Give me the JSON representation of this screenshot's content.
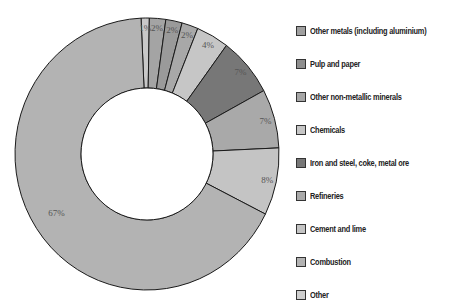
{
  "chart_data": {
    "type": "pie",
    "subtype": "donut",
    "title": "",
    "legend_position": "right",
    "slices_clockwise_from_top": [
      {
        "label": "1%",
        "value": 1,
        "color": "#c8c8c8"
      },
      {
        "label": "2%",
        "value": 2,
        "color": "#a4a4a4"
      },
      {
        "label": "2%",
        "value": 2,
        "color": "#9a9a9a"
      },
      {
        "label": "2%",
        "value": 2,
        "color": "#a8a8a8"
      },
      {
        "label": "4%",
        "value": 4,
        "color": "#c6c6c6"
      },
      {
        "label": "7%",
        "value": 7,
        "color": "#777777"
      },
      {
        "label": "7%",
        "value": 7,
        "color": "#a9a9a9"
      },
      {
        "label": "8%",
        "value": 8,
        "color": "#c4c4c4"
      },
      {
        "label": "67%",
        "value": 67,
        "color": "#b3b3b3"
      }
    ],
    "categories": [
      "Other metals (including aluminium)",
      "Pulp and paper",
      "Other non-metallic minerals",
      "Chemicals",
      "Iron and steel, coke, metal ore",
      "Refineries",
      "Cement and lime",
      "Combustion",
      "Other"
    ],
    "values": [
      1,
      2,
      2,
      4,
      7,
      7,
      8,
      67,
      2
    ]
  },
  "legend": {
    "items": [
      {
        "label": "Other metals (including aluminium)",
        "color": "#a0a0a0"
      },
      {
        "label": "Pulp and paper",
        "color": "#8e8e8e"
      },
      {
        "label": "Other non-metallic minerals",
        "color": "#a6a6a6"
      },
      {
        "label": "Chemicals",
        "color": "#c6c6c6"
      },
      {
        "label": "Iron and steel, coke, metal ore",
        "color": "#777777"
      },
      {
        "label": "Refineries",
        "color": "#a9a9a9"
      },
      {
        "label": "Cement and lime",
        "color": "#c4c4c4"
      },
      {
        "label": "Combustion",
        "color": "#b3b3b3"
      },
      {
        "label": "Other",
        "color": "#cfcfcf"
      }
    ]
  }
}
